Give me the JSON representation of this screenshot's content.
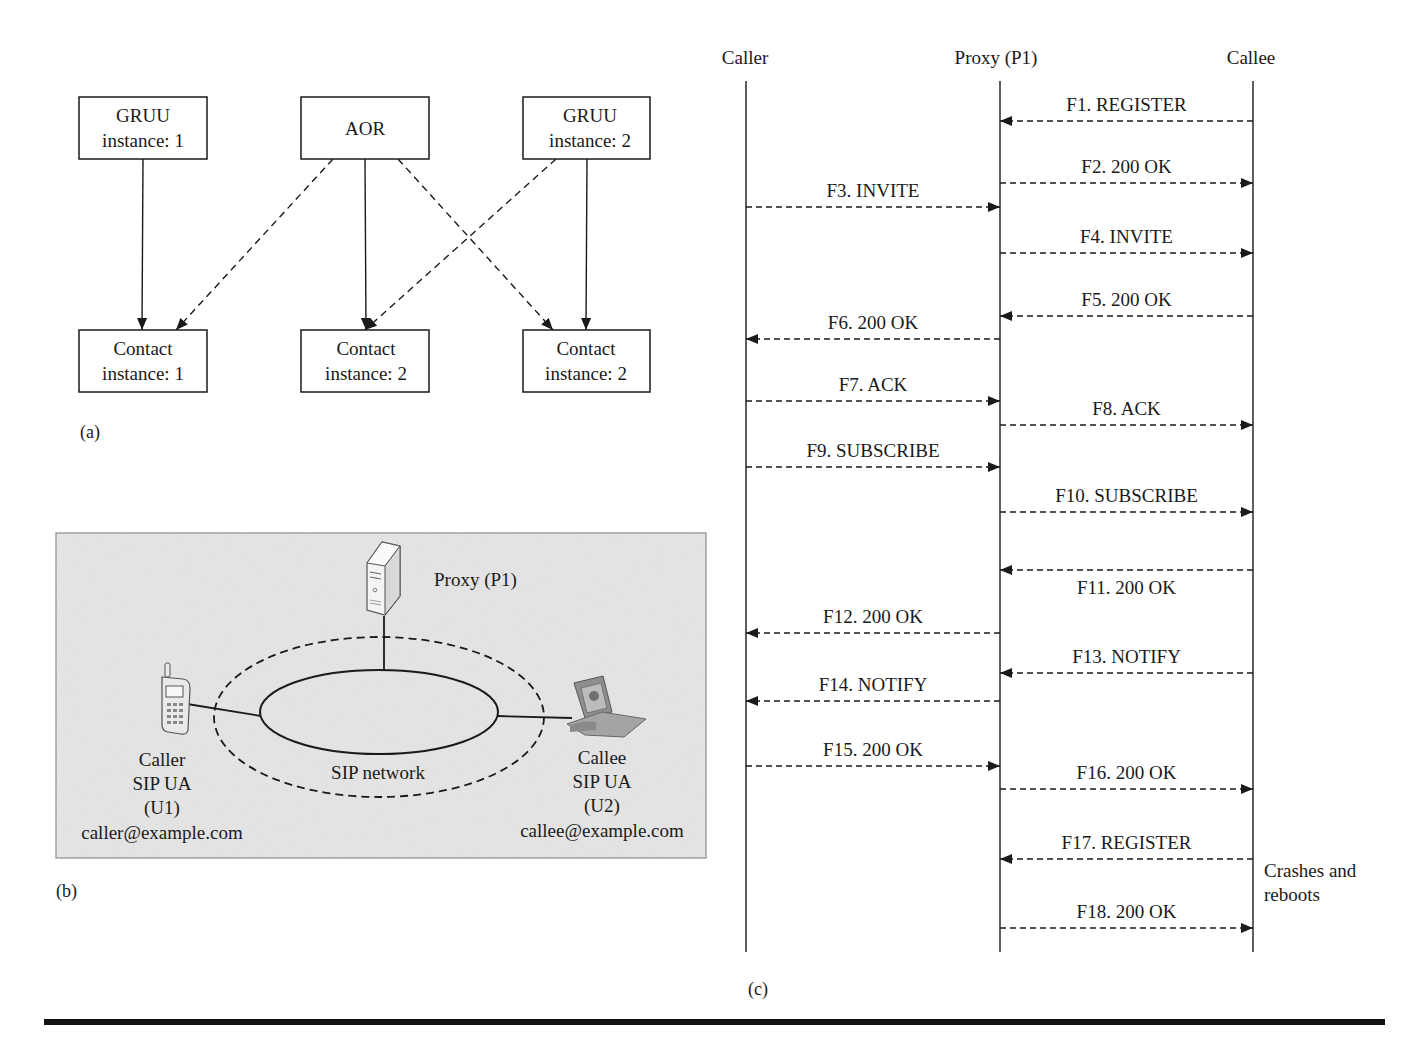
{
  "panel_a": {
    "caption": "(a)",
    "top_boxes": [
      {
        "line1": "GRUU",
        "line2": "instance: 1"
      },
      {
        "line1": "AOR",
        "line2": ""
      },
      {
        "line1": "GRUU",
        "line2": "instance: 2"
      }
    ],
    "bottom_boxes": [
      {
        "line1": "Contact",
        "line2": "instance: 1"
      },
      {
        "line1": "Contact",
        "line2": "instance: 2"
      },
      {
        "line1": "Contact",
        "line2": "instance: 2"
      }
    ],
    "edges": [
      {
        "from": 0,
        "to": 0,
        "style": "solid"
      },
      {
        "from": 1,
        "to": 0,
        "style": "dashed"
      },
      {
        "from": 1,
        "to": 1,
        "style": "solid"
      },
      {
        "from": 1,
        "to": 2,
        "style": "dashed"
      },
      {
        "from": 2,
        "to": 1,
        "style": "dashed"
      },
      {
        "from": 2,
        "to": 2,
        "style": "solid"
      }
    ]
  },
  "panel_b": {
    "caption": "(b)",
    "proxy_label": "Proxy (P1)",
    "network_label": "SIP network",
    "caller": {
      "line1": "Caller",
      "line2": "SIP UA",
      "line3": "(U1)",
      "line4": "caller@example.com"
    },
    "callee": {
      "line1": "Callee",
      "line2": "SIP UA",
      "line3": "(U2)",
      "line4": "callee@example.com"
    },
    "icons": {
      "proxy": "server-icon",
      "caller": "mobile-phone-icon",
      "callee": "video-phone-icon"
    },
    "background_color": "#e6e6e6"
  },
  "panel_c": {
    "caption": "(c)",
    "lanes": [
      "Caller",
      "Proxy (P1)",
      "Callee"
    ],
    "messages": [
      {
        "label": "F1. REGISTER",
        "from": 2,
        "to": 1
      },
      {
        "label": "F2. 200 OK",
        "from": 1,
        "to": 2
      },
      {
        "label": "F3. INVITE",
        "from": 0,
        "to": 1
      },
      {
        "label": "F4. INVITE",
        "from": 1,
        "to": 2
      },
      {
        "label": "F5. 200 OK",
        "from": 2,
        "to": 1
      },
      {
        "label": "F6. 200 OK",
        "from": 1,
        "to": 0
      },
      {
        "label": "F7. ACK",
        "from": 0,
        "to": 1
      },
      {
        "label": "F8. ACK",
        "from": 1,
        "to": 2
      },
      {
        "label": "F9. SUBSCRIBE",
        "from": 0,
        "to": 1
      },
      {
        "label": "F10. SUBSCRIBE",
        "from": 1,
        "to": 2
      },
      {
        "label": "F11. 200 OK",
        "from": 2,
        "to": 1,
        "label_below": true
      },
      {
        "label": "F12. 200 OK",
        "from": 1,
        "to": 0
      },
      {
        "label": "F13. NOTIFY",
        "from": 2,
        "to": 1
      },
      {
        "label": "F14. NOTIFY",
        "from": 1,
        "to": 0
      },
      {
        "label": "F15. 200 OK",
        "from": 0,
        "to": 1
      },
      {
        "label": "F16. 200 OK",
        "from": 1,
        "to": 2
      },
      {
        "label": "F17. REGISTER",
        "from": 2,
        "to": 1
      },
      {
        "label": "F18. 200 OK",
        "from": 1,
        "to": 2
      }
    ],
    "note": {
      "line1": "Crashes and",
      "line2": "reboots"
    }
  }
}
